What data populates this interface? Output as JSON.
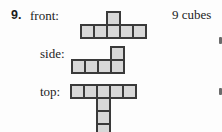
{
  "problem": {
    "number": "9.",
    "cubes_note": "9 cubes"
  },
  "views": [
    {
      "id": "front",
      "label": "front:",
      "cells": [
        [
          2,
          0
        ],
        [
          0,
          1
        ],
        [
          1,
          1
        ],
        [
          2,
          1
        ],
        [
          3,
          1
        ],
        [
          4,
          1
        ]
      ]
    },
    {
      "id": "side",
      "label": "side:",
      "cells": [
        [
          3,
          0
        ],
        [
          0,
          1
        ],
        [
          1,
          1
        ],
        [
          2,
          1
        ],
        [
          3,
          1
        ]
      ]
    },
    {
      "id": "top",
      "label": "top:",
      "cells": [
        [
          0,
          0
        ],
        [
          1,
          0
        ],
        [
          2,
          0
        ],
        [
          3,
          0
        ],
        [
          4,
          0
        ],
        [
          2,
          1
        ],
        [
          2,
          2
        ],
        [
          2,
          3
        ]
      ]
    }
  ],
  "colors": {
    "cell_fill": "#d8d8d8",
    "cell_border": "#3a3a3a",
    "text": "#1c1c1c",
    "background": "#fdfdfd"
  }
}
